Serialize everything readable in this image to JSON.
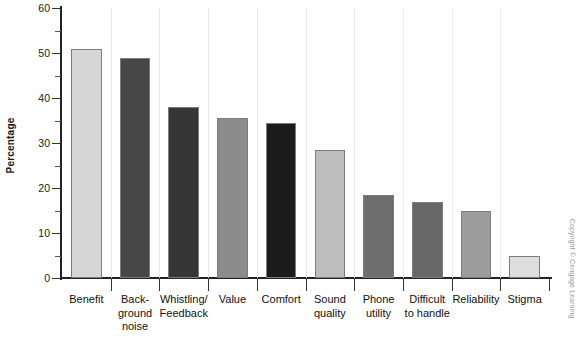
{
  "chart_data": {
    "type": "bar",
    "title": "",
    "xlabel": "",
    "ylabel": "Percentage",
    "ylim": [
      0,
      60
    ],
    "ytick_step": 10,
    "yminor_step": 5,
    "grid": true,
    "legend": false,
    "categories": [
      "Benefit",
      "Back-\nground\nnoise",
      "Whistling/\nFeedback",
      "Value",
      "Comfort",
      "Sound\nquality",
      "Phone\nutility",
      "Difficult\nto handle",
      "Reliability",
      "Stigma"
    ],
    "category_lines": [
      [
        "Benefit"
      ],
      [
        "Back-",
        "ground",
        "noise"
      ],
      [
        "Whistling/",
        "Feedback"
      ],
      [
        "Value"
      ],
      [
        "Comfort"
      ],
      [
        "Sound",
        "quality"
      ],
      [
        "Phone",
        "utility"
      ],
      [
        "Difficult",
        "to handle"
      ],
      [
        "Reliability"
      ],
      [
        "Stigma"
      ]
    ],
    "values": [
      51,
      49,
      38,
      35.5,
      34.5,
      28.5,
      18.5,
      17,
      15,
      5
    ],
    "bar_colors": [
      "#d6d6d6",
      "#474747",
      "#363636",
      "#8c8c8c",
      "#1c1c1c",
      "#bdbdbd",
      "#6e6e6e",
      "#676767",
      "#9c9c9c",
      "#dedede"
    ],
    "ytick_labels": [
      "0",
      "10",
      "20",
      "30",
      "40",
      "50",
      "60"
    ],
    "yminor_ticks": [
      5,
      15,
      25,
      35,
      45,
      55
    ]
  },
  "credit": {
    "text": "Copyright © Cengage Learning"
  }
}
